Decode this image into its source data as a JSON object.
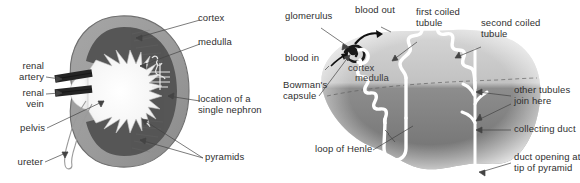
{
  "figure": {
    "background_color": "#ffffff",
    "text_color": "#2f2f2f",
    "leader_line_color": "#444444"
  },
  "left_diagram": {
    "name": "kidney-cross-section",
    "colors": {
      "cortex": "#9a9a9a",
      "medulla": "#565656",
      "pelvis": "#f2f2f2",
      "vessel": "#2b2b2b",
      "outline": "#6d6d6d"
    },
    "labels": [
      {
        "id": "cortex",
        "text": "cortex"
      },
      {
        "id": "medulla",
        "text": "medulla"
      },
      {
        "id": "renal-artery",
        "text": "renal\nartery"
      },
      {
        "id": "renal-vein",
        "text": "renal\nvein"
      },
      {
        "id": "location-single-nephron",
        "text": "location of a\nsingle nephron"
      },
      {
        "id": "pelvis",
        "text": "pelvis"
      },
      {
        "id": "ureter",
        "text": "ureter"
      },
      {
        "id": "pyramids",
        "text": "pyramids"
      }
    ]
  },
  "right_diagram": {
    "name": "nephron-detail",
    "colors": {
      "cortex_band": "#bdbdbd",
      "medulla_band": "#7e7e7e",
      "tubule": "#ffffff",
      "glomerulus": "#1a1a1a",
      "blood_arrow": "#111111"
    },
    "labels": [
      {
        "id": "glomerulus",
        "text": "glomerulus"
      },
      {
        "id": "blood-out",
        "text": "blood out"
      },
      {
        "id": "first-coiled-tubule",
        "text": "first coiled\ntubule"
      },
      {
        "id": "second-coiled-tubule",
        "text": "second coiled\ntubule"
      },
      {
        "id": "blood-in",
        "text": "blood in"
      },
      {
        "id": "bowmans-capsule",
        "text": "Bowman's\ncapsule"
      },
      {
        "id": "cortex",
        "text": "cortex"
      },
      {
        "id": "medulla",
        "text": "medulla"
      },
      {
        "id": "other-tubules-join-here",
        "text": "other tubules\njoin here"
      },
      {
        "id": "collecting-duct",
        "text": "collecting duct"
      },
      {
        "id": "duct-opening",
        "text": "duct opening at\ntip of pyramid"
      },
      {
        "id": "loop-of-henle",
        "text": "loop of Henle"
      }
    ]
  }
}
